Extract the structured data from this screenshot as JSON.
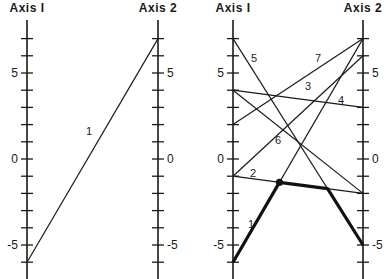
{
  "panels": [
    {
      "id": "left",
      "axis1": {
        "title": "Axis I",
        "x": 27
      },
      "axis2": {
        "title": "Axis 2",
        "x": 158
      },
      "lines": [
        {
          "label": "1",
          "a1": -6,
          "a2": 7,
          "label_pos": [
            89,
            135
          ]
        }
      ]
    },
    {
      "id": "right",
      "axis1": {
        "title": "Axis I",
        "x": 233
      },
      "axis2": {
        "title": "Axis 2",
        "x": 363
      },
      "lines": [
        {
          "label": "1",
          "a1": -6,
          "a2": 7,
          "label_pos": [
            251,
            228
          ]
        },
        {
          "label": "2",
          "a1": -1,
          "a2": -2,
          "label_pos": [
            253,
            177
          ]
        },
        {
          "label": "3",
          "a1": -1,
          "a2": 6,
          "label_pos": [
            308,
            90
          ]
        },
        {
          "label": "4",
          "a1": 4,
          "a2": 3,
          "label_pos": [
            341,
            104
          ]
        },
        {
          "label": "5",
          "a1": 7,
          "a2": -5,
          "label_pos": [
            254,
            62
          ]
        },
        {
          "label": "6",
          "a1": 4,
          "a2": -2,
          "label_pos": [
            278,
            144
          ]
        },
        {
          "label": "7",
          "a1": 2,
          "a2": 7,
          "label_pos": [
            318,
            62
          ]
        }
      ],
      "highlight_point": {
        "x": 280,
        "y": 184
      },
      "thick_path_description": "Line 1 from Axis I=-6 to intersection dot, along line 2, then down along line 5 to Axis 2=-5"
    }
  ],
  "scale": {
    "min": -6,
    "max": 7,
    "labeled_ticks": [
      5,
      0,
      -5
    ],
    "tick_labels": {
      "5": "5",
      "0": "0",
      "-5": "-5"
    },
    "zero_y": 159,
    "px_per_unit": 17.2
  },
  "colors": {
    "ink": "#1a1a1a",
    "background": "#ffffff"
  }
}
